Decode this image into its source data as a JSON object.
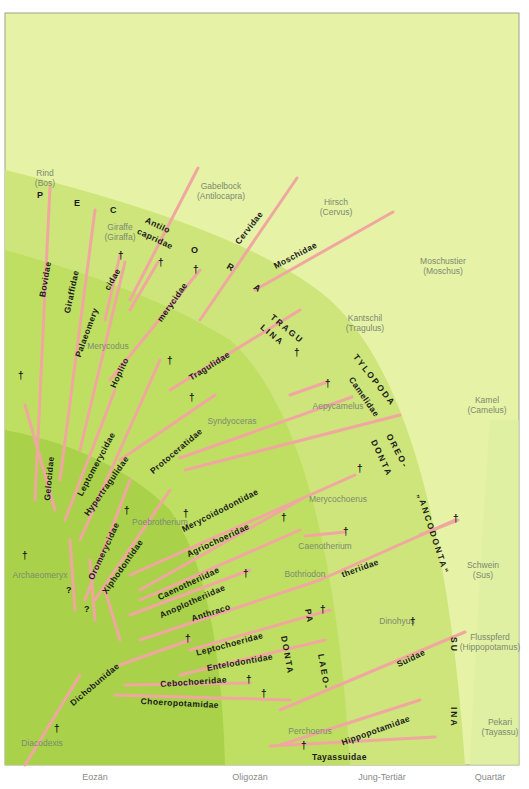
{
  "colors": {
    "background_light": "#e6f2a6",
    "band_mid": "#cde57a",
    "band_dark": "#a9d24a",
    "lineage_line": "#f0a7a0",
    "clade_text": "#1a1a1a",
    "animal_label": "#7d8a70",
    "era_label": "#8a8a8a",
    "frame_border": "#9aa38a"
  },
  "time_axis": {
    "eras": [
      {
        "label": "Eozän",
        "x": 95
      },
      {
        "label": "Oligozän",
        "x": 250
      },
      {
        "label": "Jung-Tertiär",
        "x": 382
      },
      {
        "label": "Quartär",
        "x": 490
      }
    ]
  },
  "major_groups": [
    {
      "label": "PECORA",
      "letters": [
        "P",
        "E",
        "C",
        "O",
        "R",
        "A"
      ]
    },
    {
      "label": "TRAGULINA",
      "line1": "TRAGU",
      "line2": "LINA"
    },
    {
      "label": "TYLOPODA"
    },
    {
      "label": "OREODONTA",
      "line1": "OREO-",
      "line2": "DONTA"
    },
    {
      "label": "„ANCODONTA“"
    },
    {
      "label": "PALAEODONTA",
      "line1": "PA",
      "line2": "LAEO-",
      "line3": "DONTA"
    },
    {
      "label": "SUINA",
      "line1": "SU",
      "line2": "INA"
    }
  ],
  "families": [
    {
      "name": "Bovidae"
    },
    {
      "name": "Giraffidae"
    },
    {
      "name": "Antilocapridae",
      "line1": "Antilo",
      "line2": "capridae"
    },
    {
      "name": "Cervidae"
    },
    {
      "name": "Moschidae"
    },
    {
      "name": "Palaeomerycidae",
      "line1": "Palaeomery",
      "line2": "cidae"
    },
    {
      "name": "Hoplitomerycidae",
      "line1": "Hoplito",
      "line2": "merycidae"
    },
    {
      "name": "Gelocidae"
    },
    {
      "name": "Leptomerycidae"
    },
    {
      "name": "Hypertragulidae"
    },
    {
      "name": "Tragulidae"
    },
    {
      "name": "Protoceratidae"
    },
    {
      "name": "Camelidae"
    },
    {
      "name": "Oromerycidae"
    },
    {
      "name": "Xiphodontidae"
    },
    {
      "name": "Merycoidodontidae"
    },
    {
      "name": "Agriochoeridae"
    },
    {
      "name": "Caenotheriidae"
    },
    {
      "name": "Anoplotheriidae"
    },
    {
      "name": "Anthracotheriidae",
      "line1": "Anthraco",
      "line2": "theriidae"
    },
    {
      "name": "Leptochoeridae"
    },
    {
      "name": "Entelodontidae"
    },
    {
      "name": "Dichobunidae"
    },
    {
      "name": "Cebochoeridae"
    },
    {
      "name": "Choeropotamidae"
    },
    {
      "name": "Suidae"
    },
    {
      "name": "Hippopotamidae"
    },
    {
      "name": "Tayassuidae"
    }
  ],
  "animals": [
    {
      "common": "Rind",
      "genus": "(Bos)"
    },
    {
      "common": "Giraffe",
      "genus": "(Giraffa)"
    },
    {
      "common": "Gabelbock",
      "genus": "(Antilocapra)"
    },
    {
      "common": "Hirsch",
      "genus": "(Cervus)"
    },
    {
      "common": "Moschustier",
      "genus": "(Moschus)"
    },
    {
      "common": "Kantschil",
      "genus": "(Tragulus)"
    },
    {
      "common": "Kamel",
      "genus": "(Camelus)"
    },
    {
      "common": "Schwein",
      "genus": "(Sus)"
    },
    {
      "common": "Flusspferd",
      "genus": "(Hippopotamus)"
    },
    {
      "common": "Pekari",
      "genus": "(Tayassu)"
    }
  ],
  "fossils": [
    {
      "name": "Merycodus"
    },
    {
      "name": "Syndyoceras"
    },
    {
      "name": "Aepycamelus"
    },
    {
      "name": "Archaeomeryx"
    },
    {
      "name": "Poebrotherium"
    },
    {
      "name": "Merycochoerus"
    },
    {
      "name": "Caenotherium"
    },
    {
      "name": "Bothriodon"
    },
    {
      "name": "Dinohyus"
    },
    {
      "name": "Perchoerus"
    },
    {
      "name": "Diacodexis"
    }
  ],
  "symbols": {
    "extinct": "†",
    "uncertain": "?"
  }
}
